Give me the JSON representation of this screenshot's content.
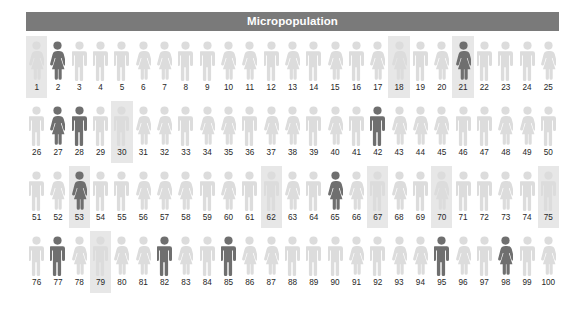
{
  "header": {
    "title": "Micropopulation",
    "bar_color": "#7a7a7a",
    "text_color": "#ffffff"
  },
  "colors": {
    "figure_light": "#dcdcdc",
    "figure_dark": "#6f6f6f",
    "highlight_background": "#e7e7e7",
    "label_color": "#262626",
    "page_background": "#ffffff"
  },
  "chart_data": {
    "type": "pictogram",
    "title": "Micropopulation",
    "xlabel": "",
    "ylabel": "",
    "total_units": 100,
    "units_per_row": 25,
    "rows": 4,
    "legend": [],
    "icon_categories": [
      "male",
      "female"
    ],
    "shade_categories": [
      "light",
      "dark"
    ],
    "counts": {
      "male": 52,
      "female": 48,
      "dark": 12,
      "light": 88,
      "highlighted": 12
    },
    "people": [
      {
        "id": 1,
        "label": "1",
        "sex": "female",
        "shade": "light",
        "highlight": true
      },
      {
        "id": 2,
        "label": "2",
        "sex": "female",
        "shade": "dark",
        "highlight": false
      },
      {
        "id": 3,
        "label": "3",
        "sex": "male",
        "shade": "light",
        "highlight": false
      },
      {
        "id": 4,
        "label": "4",
        "sex": "male",
        "shade": "light",
        "highlight": false
      },
      {
        "id": 5,
        "label": "5",
        "sex": "male",
        "shade": "light",
        "highlight": false
      },
      {
        "id": 6,
        "label": "6",
        "sex": "female",
        "shade": "light",
        "highlight": false
      },
      {
        "id": 7,
        "label": "7",
        "sex": "female",
        "shade": "light",
        "highlight": false
      },
      {
        "id": 8,
        "label": "8",
        "sex": "male",
        "shade": "light",
        "highlight": false
      },
      {
        "id": 9,
        "label": "9",
        "sex": "male",
        "shade": "light",
        "highlight": false
      },
      {
        "id": 10,
        "label": "10",
        "sex": "female",
        "shade": "light",
        "highlight": false
      },
      {
        "id": 11,
        "label": "11",
        "sex": "female",
        "shade": "light",
        "highlight": false
      },
      {
        "id": 12,
        "label": "12",
        "sex": "male",
        "shade": "light",
        "highlight": false
      },
      {
        "id": 13,
        "label": "13",
        "sex": "female",
        "shade": "light",
        "highlight": false
      },
      {
        "id": 14,
        "label": "14",
        "sex": "male",
        "shade": "light",
        "highlight": false
      },
      {
        "id": 15,
        "label": "15",
        "sex": "female",
        "shade": "light",
        "highlight": false
      },
      {
        "id": 16,
        "label": "16",
        "sex": "male",
        "shade": "light",
        "highlight": false
      },
      {
        "id": 17,
        "label": "17",
        "sex": "female",
        "shade": "light",
        "highlight": false
      },
      {
        "id": 18,
        "label": "18",
        "sex": "female",
        "shade": "light",
        "highlight": true
      },
      {
        "id": 19,
        "label": "19",
        "sex": "male",
        "shade": "light",
        "highlight": false
      },
      {
        "id": 20,
        "label": "20",
        "sex": "female",
        "shade": "light",
        "highlight": false
      },
      {
        "id": 21,
        "label": "21",
        "sex": "female",
        "shade": "dark",
        "highlight": true
      },
      {
        "id": 22,
        "label": "22",
        "sex": "male",
        "shade": "light",
        "highlight": false
      },
      {
        "id": 23,
        "label": "23",
        "sex": "male",
        "shade": "light",
        "highlight": false
      },
      {
        "id": 24,
        "label": "24",
        "sex": "male",
        "shade": "light",
        "highlight": false
      },
      {
        "id": 25,
        "label": "25",
        "sex": "female",
        "shade": "light",
        "highlight": false
      },
      {
        "id": 26,
        "label": "26",
        "sex": "male",
        "shade": "light",
        "highlight": false
      },
      {
        "id": 27,
        "label": "27",
        "sex": "female",
        "shade": "dark",
        "highlight": false
      },
      {
        "id": 28,
        "label": "28",
        "sex": "male",
        "shade": "dark",
        "highlight": false
      },
      {
        "id": 29,
        "label": "29",
        "sex": "male",
        "shade": "light",
        "highlight": false
      },
      {
        "id": 30,
        "label": "30",
        "sex": "male",
        "shade": "light",
        "highlight": true
      },
      {
        "id": 31,
        "label": "31",
        "sex": "female",
        "shade": "light",
        "highlight": false
      },
      {
        "id": 32,
        "label": "32",
        "sex": "female",
        "shade": "light",
        "highlight": false
      },
      {
        "id": 33,
        "label": "33",
        "sex": "male",
        "shade": "light",
        "highlight": false
      },
      {
        "id": 34,
        "label": "34",
        "sex": "female",
        "shade": "light",
        "highlight": false
      },
      {
        "id": 35,
        "label": "35",
        "sex": "female",
        "shade": "light",
        "highlight": false
      },
      {
        "id": 36,
        "label": "36",
        "sex": "male",
        "shade": "light",
        "highlight": false
      },
      {
        "id": 37,
        "label": "37",
        "sex": "female",
        "shade": "light",
        "highlight": false
      },
      {
        "id": 38,
        "label": "38",
        "sex": "female",
        "shade": "light",
        "highlight": false
      },
      {
        "id": 39,
        "label": "39",
        "sex": "male",
        "shade": "light",
        "highlight": false
      },
      {
        "id": 40,
        "label": "40",
        "sex": "female",
        "shade": "light",
        "highlight": false
      },
      {
        "id": 41,
        "label": "41",
        "sex": "male",
        "shade": "light",
        "highlight": false
      },
      {
        "id": 42,
        "label": "42",
        "sex": "male",
        "shade": "dark",
        "highlight": false
      },
      {
        "id": 43,
        "label": "43",
        "sex": "female",
        "shade": "light",
        "highlight": false
      },
      {
        "id": 44,
        "label": "44",
        "sex": "female",
        "shade": "light",
        "highlight": false
      },
      {
        "id": 45,
        "label": "45",
        "sex": "female",
        "shade": "light",
        "highlight": false
      },
      {
        "id": 46,
        "label": "46",
        "sex": "male",
        "shade": "light",
        "highlight": false
      },
      {
        "id": 47,
        "label": "47",
        "sex": "male",
        "shade": "light",
        "highlight": false
      },
      {
        "id": 48,
        "label": "48",
        "sex": "female",
        "shade": "light",
        "highlight": false
      },
      {
        "id": 49,
        "label": "49",
        "sex": "female",
        "shade": "light",
        "highlight": false
      },
      {
        "id": 50,
        "label": "50",
        "sex": "male",
        "shade": "light",
        "highlight": false
      },
      {
        "id": 51,
        "label": "51",
        "sex": "male",
        "shade": "light",
        "highlight": false
      },
      {
        "id": 52,
        "label": "52",
        "sex": "female",
        "shade": "light",
        "highlight": false
      },
      {
        "id": 53,
        "label": "53",
        "sex": "female",
        "shade": "dark",
        "highlight": true
      },
      {
        "id": 54,
        "label": "54",
        "sex": "male",
        "shade": "light",
        "highlight": false
      },
      {
        "id": 55,
        "label": "55",
        "sex": "male",
        "shade": "light",
        "highlight": false
      },
      {
        "id": 56,
        "label": "56",
        "sex": "female",
        "shade": "light",
        "highlight": false
      },
      {
        "id": 57,
        "label": "57",
        "sex": "female",
        "shade": "light",
        "highlight": false
      },
      {
        "id": 58,
        "label": "58",
        "sex": "female",
        "shade": "light",
        "highlight": false
      },
      {
        "id": 59,
        "label": "59",
        "sex": "male",
        "shade": "light",
        "highlight": false
      },
      {
        "id": 60,
        "label": "60",
        "sex": "female",
        "shade": "light",
        "highlight": false
      },
      {
        "id": 61,
        "label": "61",
        "sex": "male",
        "shade": "light",
        "highlight": false
      },
      {
        "id": 62,
        "label": "62",
        "sex": "male",
        "shade": "light",
        "highlight": true
      },
      {
        "id": 63,
        "label": "63",
        "sex": "female",
        "shade": "light",
        "highlight": false
      },
      {
        "id": 64,
        "label": "64",
        "sex": "male",
        "shade": "light",
        "highlight": false
      },
      {
        "id": 65,
        "label": "65",
        "sex": "female",
        "shade": "dark",
        "highlight": false
      },
      {
        "id": 66,
        "label": "66",
        "sex": "female",
        "shade": "light",
        "highlight": false
      },
      {
        "id": 67,
        "label": "67",
        "sex": "male",
        "shade": "light",
        "highlight": true
      },
      {
        "id": 68,
        "label": "68",
        "sex": "female",
        "shade": "light",
        "highlight": false
      },
      {
        "id": 69,
        "label": "69",
        "sex": "male",
        "shade": "light",
        "highlight": false
      },
      {
        "id": 70,
        "label": "70",
        "sex": "female",
        "shade": "light",
        "highlight": true
      },
      {
        "id": 71,
        "label": "71",
        "sex": "male",
        "shade": "light",
        "highlight": false
      },
      {
        "id": 72,
        "label": "72",
        "sex": "male",
        "shade": "light",
        "highlight": false
      },
      {
        "id": 73,
        "label": "73",
        "sex": "female",
        "shade": "light",
        "highlight": false
      },
      {
        "id": 74,
        "label": "74",
        "sex": "male",
        "shade": "light",
        "highlight": false
      },
      {
        "id": 75,
        "label": "75",
        "sex": "male",
        "shade": "light",
        "highlight": true
      },
      {
        "id": 76,
        "label": "76",
        "sex": "male",
        "shade": "light",
        "highlight": false
      },
      {
        "id": 77,
        "label": "77",
        "sex": "male",
        "shade": "dark",
        "highlight": false
      },
      {
        "id": 78,
        "label": "78",
        "sex": "female",
        "shade": "light",
        "highlight": false
      },
      {
        "id": 79,
        "label": "79",
        "sex": "male",
        "shade": "light",
        "highlight": true
      },
      {
        "id": 80,
        "label": "80",
        "sex": "female",
        "shade": "light",
        "highlight": false
      },
      {
        "id": 81,
        "label": "81",
        "sex": "female",
        "shade": "light",
        "highlight": false
      },
      {
        "id": 82,
        "label": "82",
        "sex": "male",
        "shade": "dark",
        "highlight": false
      },
      {
        "id": 83,
        "label": "83",
        "sex": "female",
        "shade": "light",
        "highlight": false
      },
      {
        "id": 84,
        "label": "84",
        "sex": "male",
        "shade": "light",
        "highlight": false
      },
      {
        "id": 85,
        "label": "85",
        "sex": "male",
        "shade": "dark",
        "highlight": false
      },
      {
        "id": 86,
        "label": "86",
        "sex": "female",
        "shade": "light",
        "highlight": false
      },
      {
        "id": 87,
        "label": "87",
        "sex": "female",
        "shade": "light",
        "highlight": false
      },
      {
        "id": 88,
        "label": "88",
        "sex": "male",
        "shade": "light",
        "highlight": false
      },
      {
        "id": 89,
        "label": "89",
        "sex": "male",
        "shade": "light",
        "highlight": false
      },
      {
        "id": 90,
        "label": "90",
        "sex": "male",
        "shade": "light",
        "highlight": false
      },
      {
        "id": 91,
        "label": "91",
        "sex": "female",
        "shade": "light",
        "highlight": false
      },
      {
        "id": 92,
        "label": "92",
        "sex": "male",
        "shade": "light",
        "highlight": false
      },
      {
        "id": 93,
        "label": "93",
        "sex": "female",
        "shade": "light",
        "highlight": false
      },
      {
        "id": 94,
        "label": "94",
        "sex": "female",
        "shade": "light",
        "highlight": false
      },
      {
        "id": 95,
        "label": "95",
        "sex": "male",
        "shade": "dark",
        "highlight": false
      },
      {
        "id": 96,
        "label": "96",
        "sex": "female",
        "shade": "light",
        "highlight": false
      },
      {
        "id": 97,
        "label": "97",
        "sex": "male",
        "shade": "light",
        "highlight": false
      },
      {
        "id": 98,
        "label": "98",
        "sex": "female",
        "shade": "dark",
        "highlight": false
      },
      {
        "id": 99,
        "label": "99",
        "sex": "male",
        "shade": "light",
        "highlight": false
      },
      {
        "id": 100,
        "label": "100",
        "sex": "female",
        "shade": "light",
        "highlight": false
      }
    ]
  }
}
